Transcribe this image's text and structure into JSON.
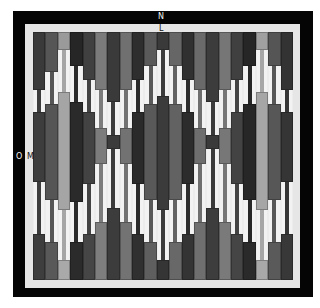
{
  "labels": {
    "north": "N",
    "top_inner": "L",
    "west": "O",
    "left_inner": "M"
  },
  "colors": {
    "frame": "#050505",
    "mat": "#ececec",
    "stripe_light": "#f2f2f2"
  },
  "pattern": {
    "columns": [
      {
        "top": "#3a3a3a",
        "topH": 58,
        "mid": "#3d3d3d",
        "midTop": 60,
        "midH": 80,
        "bot": "#3e3e3e",
        "botH": 46
      },
      {
        "top": "#565656",
        "topH": 40,
        "mid": "#555555",
        "midTop": 52,
        "midH": 106,
        "bot": "#595959",
        "botH": 38
      },
      {
        "top": "#9a9a9a",
        "topH": 18,
        "mid": "#a5a5a5",
        "midTop": 40,
        "midH": 128,
        "bot": "#a9a9a9",
        "botH": 20
      },
      {
        "top": "#262626",
        "topH": 34,
        "mid": "#2a2a2a",
        "midTop": 50,
        "midH": 110,
        "bot": "#2b2b2b",
        "botH": 38
      },
      {
        "top": "#404040",
        "topH": 48,
        "mid": "#434343",
        "midTop": 60,
        "midH": 82,
        "bot": "#464646",
        "botH": 46
      },
      {
        "top": "#7b7b7b",
        "topH": 58,
        "mid": "#7c7c7c",
        "midTop": 76,
        "midH": 46,
        "bot": "#7e7e7e",
        "botH": 58
      },
      {
        "top": "#3a3a3a",
        "topH": 70,
        "mid": "#3c3c3c",
        "midTop": 83,
        "midH": 24,
        "bot": "#3c3c3c",
        "botH": 72
      },
      {
        "top": "#707070",
        "topH": 58,
        "mid": "#727272",
        "midTop": 76,
        "midH": 46,
        "bot": "#737373",
        "botH": 58
      },
      {
        "top": "#2e2e2e",
        "topH": 48,
        "mid": "#2a2a2a",
        "midTop": 60,
        "midH": 82,
        "bot": "#303030",
        "botH": 46
      },
      {
        "top": "#5a5a5a",
        "topH": 34,
        "mid": "#595959",
        "midTop": 52,
        "midH": 106,
        "bot": "#5f5f5f",
        "botH": 38
      },
      {
        "top": "#3a3a3a",
        "topH": 18,
        "mid": "#3b3b3b",
        "midTop": 44,
        "midH": 124,
        "bot": "#353535",
        "botH": 20
      },
      {
        "top": "#666666",
        "topH": 34,
        "mid": "#626262",
        "midTop": 52,
        "midH": 106,
        "bot": "#686868",
        "botH": 38
      },
      {
        "top": "#303030",
        "topH": 48,
        "mid": "#2c2c2c",
        "midTop": 60,
        "midH": 82,
        "bot": "#343434",
        "botH": 46
      },
      {
        "top": "#6a6a6a",
        "topH": 58,
        "mid": "#6e6e6e",
        "midTop": 76,
        "midH": 46,
        "bot": "#6f6f6f",
        "botH": 58
      },
      {
        "top": "#3c3c3c",
        "topH": 70,
        "mid": "#3a3a3a",
        "midTop": 83,
        "midH": 24,
        "bot": "#3d3d3d",
        "botH": 72
      },
      {
        "top": "#767676",
        "topH": 58,
        "mid": "#777777",
        "midTop": 76,
        "midH": 46,
        "bot": "#7a7a7a",
        "botH": 58
      },
      {
        "top": "#404040",
        "topH": 48,
        "mid": "#434343",
        "midTop": 60,
        "midH": 82,
        "bot": "#454545",
        "botH": 46
      },
      {
        "top": "#262626",
        "topH": 34,
        "mid": "#272727",
        "midTop": 52,
        "midH": 106,
        "bot": "#2a2a2a",
        "botH": 38
      },
      {
        "top": "#a0a0a0",
        "topH": 18,
        "mid": "#a6a6a6",
        "midTop": 40,
        "midH": 128,
        "bot": "#a8a8a8",
        "botH": 20
      },
      {
        "top": "#555555",
        "topH": 34,
        "mid": "#575757",
        "midTop": 52,
        "midH": 106,
        "bot": "#5a5a5a",
        "botH": 38
      },
      {
        "top": "#333333",
        "topH": 58,
        "mid": "#353535",
        "midTop": 60,
        "midH": 80,
        "bot": "#383838",
        "botH": 46
      }
    ]
  }
}
